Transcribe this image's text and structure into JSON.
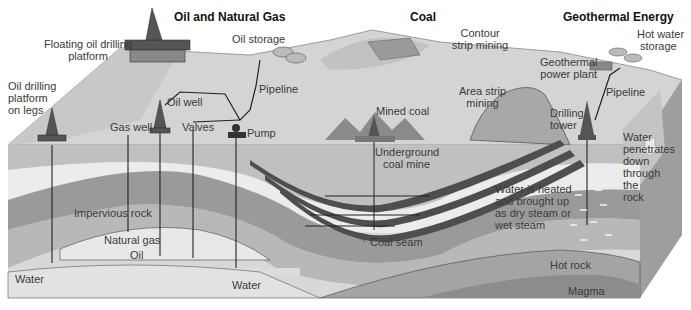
{
  "headers": {
    "oil_gas": "Oil and Natural Gas",
    "coal": "Coal",
    "geothermal": "Geothermal Energy"
  },
  "labels": {
    "floating_platform": [
      "Floating oil drilling",
      "platform"
    ],
    "platform_on_legs": [
      "Oil drilling",
      "platform",
      "on legs"
    ],
    "oil_storage": "Oil storage",
    "pipeline_oil": "Pipeline",
    "oil_well": "Oil well",
    "gas_well": "Gas well",
    "valves": "Valves",
    "pump": "Pump",
    "impervious_rock": "Impervious rock",
    "natural_gas": "Natural gas",
    "oil": "Oil",
    "water_left": "Water",
    "water_mid": "Water",
    "contour_strip_mining": [
      "Contour",
      "strip mining"
    ],
    "mined_coal": "Mined coal",
    "area_strip_mining": [
      "Area strip",
      "mining"
    ],
    "underground_coal_mine": [
      "Underground",
      "coal mine"
    ],
    "coal_seam": "Coal seam",
    "geothermal_power_plant": [
      "Geothermal",
      "power plant"
    ],
    "hot_water_storage": [
      "Hot water",
      "storage"
    ],
    "pipeline_geo": "Pipeline",
    "drilling_tower": [
      "Drilling",
      "tower"
    ],
    "water_penetrates": [
      "Water",
      "penetrates",
      "down",
      "through",
      "the",
      "rock"
    ],
    "water_heated": [
      "Water is heated",
      "and brought up",
      "as dry steam or",
      "wet steam"
    ],
    "hot_rock": "Hot rock",
    "magma": "Magma"
  },
  "colors": {
    "surface": "#d6d6d6",
    "layer_light": "#e6e6e6",
    "layer_mid": "#b4b4b4",
    "layer_dark": "#8e8e8e",
    "coal": "#4a4a4a",
    "side_face": "#9a9a9a",
    "line": "#222222"
  }
}
